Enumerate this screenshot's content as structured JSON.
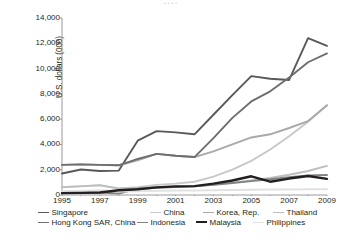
{
  "figure": {
    "cropped_header_text": "• •            • •",
    "background_color": "#ffffff"
  },
  "chart_data": {
    "type": "line",
    "title": "",
    "xlabel": "",
    "ylabel": "U.S. dollars (000)",
    "x": [
      1995,
      1996,
      1997,
      1998,
      1999,
      2000,
      2001,
      2002,
      2003,
      2004,
      2005,
      2006,
      2007,
      2008,
      2009
    ],
    "xlim": [
      1995,
      2009
    ],
    "ylim": [
      0,
      14000
    ],
    "ytick_values": [
      0,
      2000,
      4000,
      6000,
      8000,
      10000,
      12000,
      14000
    ],
    "ytick_labels": [
      "0",
      "2,000",
      "4,000",
      "6,000",
      "8,000",
      "10,000",
      "12,000",
      "14,000"
    ],
    "xtick_values": [
      1995,
      1997,
      1999,
      2001,
      2003,
      2005,
      2007,
      2009
    ],
    "xtick_labels": [
      "1995",
      "1997",
      "1999",
      "2001",
      "2003",
      "2005",
      "2007",
      "2009"
    ],
    "grid": false,
    "legend_position": "below",
    "series": [
      {
        "name": "Singapore",
        "color": "#58595b",
        "width": 1.9,
        "values": [
          1700,
          2020,
          1900,
          1930,
          4300,
          5050,
          4950,
          4800,
          6350,
          7900,
          9400,
          9200,
          9100,
          12400,
          11800
        ]
      },
      {
        "name": "China",
        "color": "#c7c8ca",
        "width": 1.9,
        "values": [
          620,
          700,
          760,
          520,
          620,
          800,
          900,
          1050,
          1450,
          2000,
          2700,
          3600,
          4650,
          5800,
          7100
        ]
      },
      {
        "name": "Korea, Rep.",
        "color": "#a7a9ac",
        "width": 1.9,
        "values": [
          2380,
          2420,
          2380,
          2350,
          2750,
          3250,
          3100,
          3000,
          3450,
          4000,
          4550,
          4800,
          5300,
          5850,
          7100
        ]
      },
      {
        "name": "Thailand",
        "color": "#bcbec0",
        "width": 1.9,
        "values": [
          620,
          680,
          780,
          500,
          560,
          620,
          650,
          700,
          820,
          980,
          1150,
          1350,
          1600,
          1900,
          2300
        ]
      },
      {
        "name": "Hong Kong SAR, China",
        "color": "#6d6e71",
        "width": 1.9,
        "values": [
          2380,
          2420,
          2380,
          2350,
          2850,
          3250,
          3100,
          3000,
          4500,
          6100,
          7400,
          8200,
          9300,
          10500,
          11200
        ]
      },
      {
        "name": "Indonesia",
        "color": "#808285",
        "width": 1.9,
        "values": [
          150,
          170,
          190,
          120,
          480,
          560,
          620,
          680,
          800,
          950,
          1100,
          1250,
          1400,
          1550,
          1580
        ]
      },
      {
        "name": "Malaysia",
        "color": "#231f20",
        "width": 2.4,
        "values": [
          150,
          170,
          200,
          380,
          450,
          600,
          680,
          700,
          900,
          1150,
          1480,
          1050,
          1300,
          1500,
          1280
        ]
      },
      {
        "name": "Philippines",
        "color": "#e0e1e2",
        "width": 1.9,
        "values": [
          300,
          330,
          380,
          280,
          300,
          330,
          350,
          360,
          380,
          400,
          420,
          430,
          440,
          450,
          460
        ]
      }
    ]
  },
  "legend": {
    "row1": [
      "Singapore",
      "China",
      "Korea, Rep.",
      "Thailand"
    ],
    "row2": [
      "Hong Kong SAR, China",
      "Indonesia",
      "Malaysia",
      "Philippines"
    ]
  },
  "axis": {
    "line_color": "#808285"
  }
}
